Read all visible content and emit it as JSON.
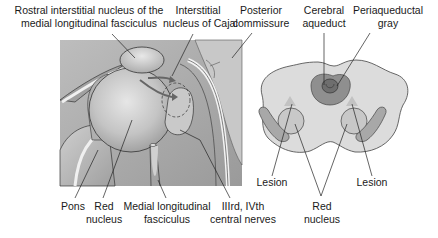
{
  "left_panel": {
    "labels": {
      "rostral_imlf": "Rostral interstitial nucleus of the\nmedial longitudinal fasciculus",
      "cajal": "Interstitial\nnucleus of Cajal",
      "posterior_commissure": "Posterior\ncommissure",
      "pons": "Pons",
      "red_nucleus": "Red\nnucleus",
      "mlf": "Medial longitudinal\nfasciculus",
      "cranial_nerves": "IIIrd, IVth\ncentral nerves"
    }
  },
  "right_panel": {
    "labels": {
      "cerebral_aqueduct": "Cerebral\naqueduct",
      "periaqueductal_gray": "Periaqueductal\ngray",
      "lesion_left": "Lesion",
      "lesion_right": "Lesion",
      "red_nucleus": "Red\nnucleus"
    }
  },
  "colors": {
    "background": "#ffffff",
    "tissue_light": "#d9d9d9",
    "tissue_mid": "#b5b5b5",
    "tissue_dark": "#8f8f8f",
    "outline": "#333333",
    "label_text": "#1a1a1a"
  }
}
